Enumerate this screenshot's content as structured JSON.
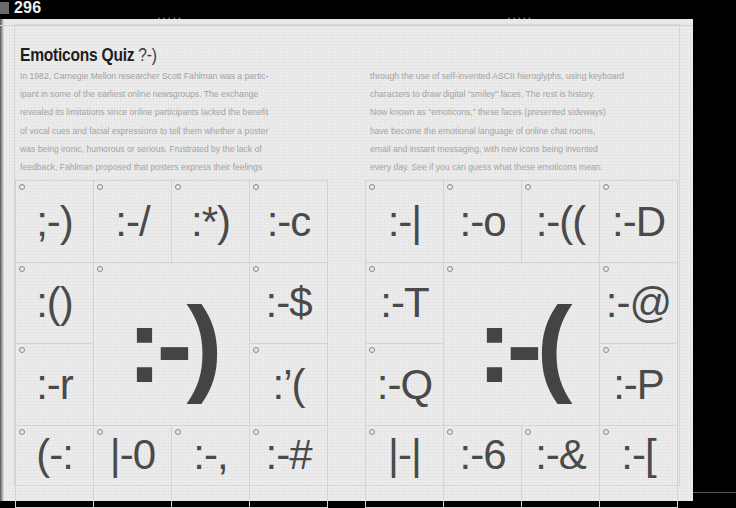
{
  "page": {
    "number": "296",
    "header_marks": [
      "• • • • •",
      "• • • • •"
    ]
  },
  "article": {
    "title": "Emoticons Quiz",
    "title_smiley": "?-)",
    "column_left": [
      "In 1982, Carnegie Mellon researcher Scott Fahlman was a partic-",
      "ipant in some of the earliest online newsgroups. The exchange",
      "revealed its limitations since online participants lacked the benefit",
      "of vocal cues and facial expressions to tell them whether a poster",
      "was being ironic, humorous or serious. Frustrated by the lack of",
      "feedback, Fahlman proposed that posters express their feelings"
    ],
    "column_right": [
      "through the use of self-invented ASCII hieroglyphs, using keyboard",
      "characters to draw digital “smiley” faces. The rest is history.",
      "Now known as “emoticons,” these faces (presented sideways)",
      "have become the emotional language of online chat rooms,",
      "email and instant messaging, with new icons being invented",
      "every day. See if you can guess what these emoticons mean."
    ]
  },
  "quiz": {
    "left_grid": {
      "row1": [
        ";-)",
        ":-/",
        ":*)",
        ":-c"
      ],
      "row2_left": ":()",
      "row3_left": ":-r",
      "big": ":-)",
      "row2_right": ":-$",
      "row3_right": ":’(",
      "row4": [
        "(-:",
        "|-0",
        ":-,",
        ":-#"
      ]
    },
    "right_grid": {
      "row1": [
        ":-|",
        ":-o",
        ":-((",
        ":-D"
      ],
      "row2_left": ":-T",
      "row3_left": ":-Q",
      "big": ":-(",
      "row2_right": ":-@",
      "row3_right": ":-P",
      "row4": [
        "|-|",
        ":-6",
        ":-&",
        ":-["
      ]
    }
  },
  "colors": {
    "page_bg": "#ececec",
    "title": "#1e1e1e",
    "body_text": "#a3a3a3",
    "emoticon": "#4a4a4a",
    "grid_line": "#d3d3d3"
  }
}
